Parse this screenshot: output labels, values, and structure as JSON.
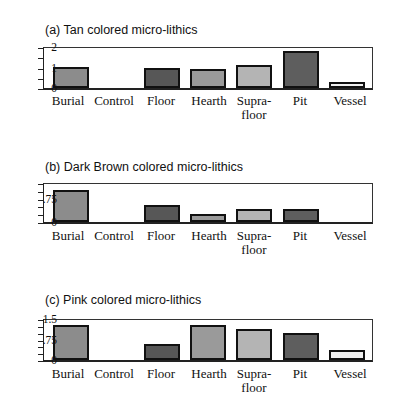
{
  "chart_data": [
    {
      "type": "bar",
      "title": "(a) Tan colored micro-lithics",
      "categories": [
        "Burial",
        "Control",
        "Floor",
        "Hearth",
        "Supra-floor",
        "Pit",
        "Vessel"
      ],
      "values": [
        1.0,
        0,
        0.95,
        0.88,
        1.07,
        1.77,
        0.25
      ],
      "ylim": [
        0,
        2
      ],
      "yticks": [
        0,
        1,
        2
      ],
      "ytick_labels": [
        "0",
        "1",
        "2"
      ],
      "xlabel": "",
      "ylabel": "",
      "grid": false,
      "legend": "none"
    },
    {
      "type": "bar",
      "title": "(b) Dark Brown colored micro-lithics",
      "categories": [
        "Burial",
        "Control",
        "Floor",
        "Hearth",
        "Supra-floor",
        "Pit",
        "Vessel"
      ],
      "values": [
        1.0,
        0,
        0.5,
        0.23,
        0.4,
        0.38,
        0
      ],
      "ylim": [
        0,
        1.25
      ],
      "yticks": [
        0,
        0.75
      ],
      "ytick_labels": [
        "0",
        ".75"
      ],
      "xlabel": "",
      "ylabel": "",
      "grid": false,
      "legend": "none"
    },
    {
      "type": "bar",
      "title": "(c) Pink colored micro-lithics",
      "categories": [
        "Burial",
        "Control",
        "Floor",
        "Hearth",
        "Supra-floor",
        "Pit",
        "Vessel"
      ],
      "values": [
        1.25,
        0,
        0.55,
        1.25,
        1.1,
        0.95,
        0.32
      ],
      "ylim": [
        0,
        1.5
      ],
      "yticks": [
        0,
        0.75,
        1.5
      ],
      "ytick_labels": [
        "0",
        ".75",
        "1.5"
      ],
      "xlabel": "",
      "ylabel": "",
      "grid": false,
      "legend": "none"
    }
  ],
  "category_labels": [
    "Burial",
    "Control",
    "Floor",
    "Hearth",
    "Supra-\nfloor",
    "Pit",
    "Vessel"
  ],
  "bar_colors": [
    "#8c8c8c",
    "#ffffff",
    "#575757",
    "#9a9a9a",
    "#b4b4b4",
    "#5e5e5e",
    "#f0f0f0"
  ]
}
